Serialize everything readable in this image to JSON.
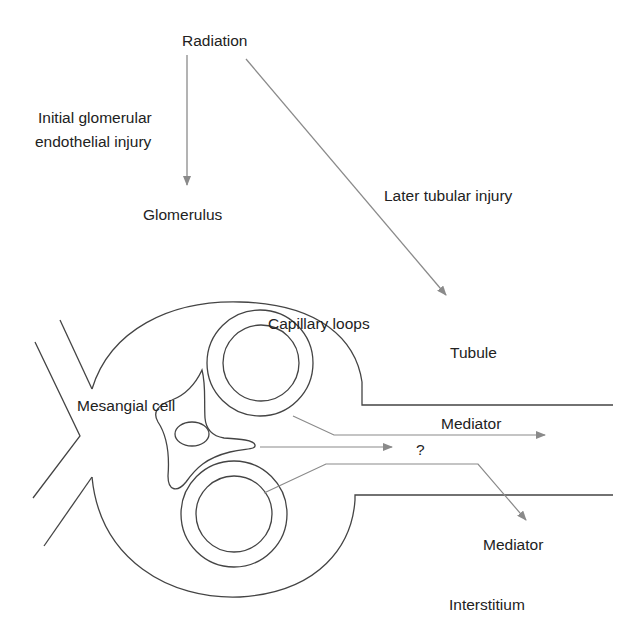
{
  "diagram": {
    "labels": {
      "radiation": "Radiation",
      "initial_injury_line1": "Initial glomerular",
      "initial_injury_line2": "endothelial injury",
      "glomerulus": "Glomerulus",
      "later_injury": "Later tubular injury",
      "capillary_loops": "Capillary loops",
      "tubule": "Tubule",
      "mesangial_cell": "Mesangial cell",
      "mediator_tubule": "Mediator",
      "question": "?",
      "mediator_interstitium": "Mediator",
      "interstitium": "Interstitium"
    },
    "colors": {
      "outline": "#444444",
      "arrow": "#8a8a8a",
      "text": "#222222",
      "background": "#ffffff"
    }
  }
}
